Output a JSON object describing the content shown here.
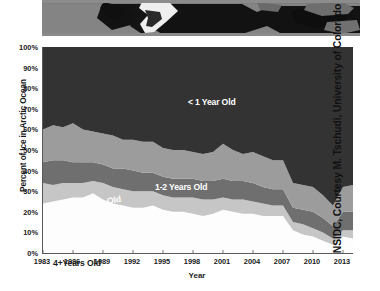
{
  "photo": {
    "alt_name": "arctic-sea-ice-satellite-strip",
    "ocean_color": "#111111",
    "land_color": "#7c7c7c",
    "ice_color": "#f2f2f2"
  },
  "credit": {
    "text": "NSIDC, Courtesy M. Tschudi, University of Colorado"
  },
  "chart_data": {
    "type": "area",
    "title": "",
    "xlabel": "Year",
    "ylabel": "Percent of Ice in Arctic Ocean",
    "ylim": [
      0,
      100
    ],
    "xlim": [
      1983,
      2014
    ],
    "grid": false,
    "legend_position": "in-plot-labels",
    "stacked": true,
    "stack_order": "bottom-to-top",
    "y_tick_labels": [
      "0%",
      "10%",
      "20%",
      "30%",
      "40%",
      "50%",
      "60%",
      "70%",
      "80%",
      "90%",
      "100%"
    ],
    "y_tick_values": [
      0,
      10,
      20,
      30,
      40,
      50,
      60,
      70,
      80,
      90,
      100
    ],
    "x_tick_labels": [
      "1983",
      "1986",
      "1989",
      "1992",
      "1995",
      "1998",
      "2001",
      "2004",
      "2007",
      "2010",
      "2013"
    ],
    "x_tick_values": [
      1983,
      1986,
      1989,
      1992,
      1995,
      1998,
      2001,
      2004,
      2007,
      2010,
      2013
    ],
    "x": [
      1983,
      1984,
      1985,
      1986,
      1987,
      1988,
      1989,
      1990,
      1991,
      1992,
      1993,
      1994,
      1995,
      1996,
      1997,
      1998,
      1999,
      2000,
      2001,
      2002,
      2003,
      2004,
      2005,
      2006,
      2007,
      2008,
      2009,
      2010,
      2011,
      2012,
      2013,
      2014
    ],
    "series": [
      {
        "name": "4+ Years Old",
        "label": "4+Years Old",
        "color": "#fdfdfd",
        "label_color": "#1a1a1a",
        "values": [
          24,
          25,
          26,
          27,
          27,
          29,
          26,
          24,
          23,
          22,
          22,
          23,
          21,
          20,
          20,
          19,
          18,
          19,
          21,
          20,
          19,
          19,
          18,
          18,
          18,
          11,
          9,
          8,
          6,
          4,
          8,
          7
        ]
      },
      {
        "name": "3-4 Years Old",
        "label": "3-4 Years Old",
        "color": "#c6c6c6",
        "label_color": "#ffffff",
        "values": [
          10,
          8,
          8,
          7,
          7,
          6,
          8,
          8,
          8,
          8,
          8,
          7,
          7,
          7,
          7,
          8,
          8,
          7,
          6,
          6,
          7,
          6,
          6,
          5,
          5,
          4,
          5,
          4,
          4,
          3,
          3,
          4
        ]
      },
      {
        "name": "2-3 Years Old",
        "label": "2-3 Years Old",
        "color": "#6f6f6f",
        "label_color": "#ffffff",
        "values": [
          10,
          12,
          11,
          10,
          10,
          9,
          9,
          9,
          10,
          10,
          9,
          9,
          9,
          9,
          9,
          9,
          9,
          9,
          9,
          9,
          9,
          9,
          8,
          8,
          8,
          7,
          7,
          8,
          7,
          6,
          9,
          9
        ]
      },
      {
        "name": "1-2 Years Old",
        "label": "1-2 Years Old",
        "color": "#9c9c9c",
        "label_color": "#ffffff",
        "values": [
          16,
          17,
          16,
          19,
          16,
          15,
          15,
          16,
          14,
          15,
          15,
          15,
          14,
          14,
          14,
          13,
          13,
          14,
          17,
          15,
          13,
          15,
          15,
          14,
          14,
          12,
          12,
          12,
          11,
          10,
          12,
          13
        ]
      },
      {
        "name": "< 1 Year Old",
        "label": "< 1 Year Old",
        "color": "#333333",
        "label_color": "#ffffff",
        "values": [
          40,
          38,
          39,
          37,
          40,
          41,
          42,
          43,
          45,
          45,
          46,
          46,
          49,
          50,
          50,
          51,
          52,
          51,
          47,
          50,
          52,
          51,
          53,
          55,
          55,
          66,
          67,
          68,
          72,
          77,
          68,
          67
        ]
      }
    ]
  }
}
